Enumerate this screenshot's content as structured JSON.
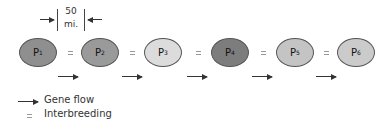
{
  "scale": {
    "value": "50",
    "unit": "mi."
  },
  "populations": [
    {
      "label": "P",
      "sub": "1",
      "color": "#8f8f8f",
      "x": 19
    },
    {
      "label": "P",
      "sub": "2",
      "color": "#9a9a9a",
      "x": 81
    },
    {
      "label": "P",
      "sub": "3",
      "color": "#dcdcdc",
      "x": 144
    },
    {
      "label": "P",
      "sub": "4",
      "color": "#7d7d7d",
      "x": 211
    },
    {
      "label": "P",
      "sub": "5",
      "color": "#c4c4c4",
      "x": 276
    },
    {
      "label": "P",
      "sub": "6",
      "color": "#cbcbcb",
      "x": 337
    }
  ],
  "legend": {
    "gene_flow": "Gene flow",
    "interbreeding": "Interbreeding"
  }
}
